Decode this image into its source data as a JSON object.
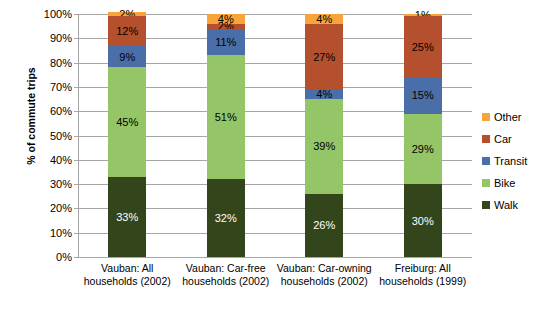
{
  "chart_data": {
    "type": "bar",
    "subtype": "stacked-100-percent",
    "title": "",
    "xlabel": "",
    "ylabel": "% of commute trips",
    "ylim": [
      0,
      100
    ],
    "ytick_labels": [
      "100%",
      "90%",
      "80%",
      "70%",
      "60%",
      "50%",
      "40%",
      "30%",
      "20%",
      "10%",
      "0%"
    ],
    "ytick_values": [
      100,
      90,
      80,
      70,
      60,
      50,
      40,
      30,
      20,
      10,
      0
    ],
    "grid": true,
    "legend_position": "right",
    "categories": [
      "Vauban: All households (2002)",
      "Vauban: Car-free households (2002)",
      "Vauban: Car-owning households (2002)",
      "Freiburg: All households (1999)"
    ],
    "series": [
      {
        "name": "Walk",
        "color": "#33461b",
        "values": [
          33,
          32,
          26,
          30
        ],
        "labels": [
          "33%",
          "32%",
          "26%",
          "30%"
        ]
      },
      {
        "name": "Bike",
        "color": "#94c567",
        "values": [
          45,
          51,
          39,
          29
        ],
        "labels": [
          "45%",
          "51%",
          "39%",
          "29%"
        ]
      },
      {
        "name": "Transit",
        "color": "#4a6fa8",
        "values": [
          9,
          11,
          4,
          15
        ],
        "labels": [
          "9%",
          "11%",
          "4%",
          "15%"
        ]
      },
      {
        "name": "Car",
        "color": "#b5502e",
        "values": [
          12,
          2,
          27,
          25
        ],
        "labels": [
          "12%",
          "2%",
          "27%",
          "25%"
        ]
      },
      {
        "name": "Other",
        "color": "#f7a53b",
        "values": [
          2,
          4,
          4,
          1
        ],
        "labels": [
          "2%",
          "4%",
          "4%",
          "1%"
        ]
      }
    ]
  },
  "axis": {
    "y_title": "% of commute trips",
    "ticks": [
      {
        "label": "100%",
        "value": 100
      },
      {
        "label": "90%",
        "value": 90
      },
      {
        "label": "80%",
        "value": 80
      },
      {
        "label": "70%",
        "value": 70
      },
      {
        "label": "60%",
        "value": 60
      },
      {
        "label": "50%",
        "value": 50
      },
      {
        "label": "40%",
        "value": 40
      },
      {
        "label": "30%",
        "value": 30
      },
      {
        "label": "20%",
        "value": 20
      },
      {
        "label": "10%",
        "value": 10
      },
      {
        "label": "0%",
        "value": 0
      }
    ]
  },
  "legend": {
    "items": [
      {
        "label": "Other",
        "color": "#f7a53b"
      },
      {
        "label": "Car",
        "color": "#b5502e"
      },
      {
        "label": "Transit",
        "color": "#4a6fa8"
      },
      {
        "label": "Bike",
        "color": "#94c567"
      },
      {
        "label": "Walk",
        "color": "#33461b"
      }
    ]
  }
}
